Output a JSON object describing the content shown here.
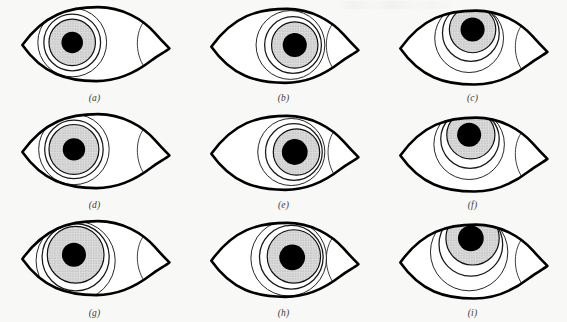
{
  "figure": {
    "caption_top": "",
    "background_color": "#f8f8f6",
    "ink_color": "#000000",
    "iris_fill_color": "#d8d8d8",
    "pupil_color": "#000000",
    "sclera_color": "#ffffff",
    "columns": 3,
    "rows": 3,
    "panel_count": 9
  },
  "panels": [
    {
      "id": "a",
      "label": "(a)",
      "label_letter": "a",
      "gaze": "center",
      "description": "Eye looking straight ahead; iris centred in palpebral fissure",
      "iris": {
        "cx": 66,
        "cy": 47,
        "r": 27,
        "fill": "#d8d8d8"
      },
      "pupil": {
        "cx": 66,
        "cy": 47,
        "r": 12.5,
        "fill": "#000000"
      },
      "limbus_ring": {
        "cx": 66,
        "cy": 47,
        "r": 33
      },
      "outer_ring": {
        "cx": 66,
        "cy": 47,
        "r": 40
      },
      "eye_width": 175,
      "eye_height": 96
    },
    {
      "id": "b",
      "label": "(b)",
      "label_letter": "b",
      "gaze": "right",
      "description": "Eye deviated to the patient's right (viewer's right); iris displaced toward inner canthus",
      "iris": {
        "cx": 105,
        "cy": 50,
        "r": 27,
        "fill": "#d8d8d8"
      },
      "pupil": {
        "cx": 105,
        "cy": 50,
        "r": 14,
        "fill": "#000000"
      },
      "limbus_ring": {
        "cx": 103,
        "cy": 50,
        "r": 33
      },
      "outer_ring": {
        "cx": 100,
        "cy": 50,
        "r": 40
      },
      "eye_width": 175,
      "eye_height": 96
    },
    {
      "id": "c",
      "label": "(c)",
      "label_letter": "c",
      "gaze": "up-right",
      "description": "Eye deviated upward and slightly right; iris rides under the upper lid",
      "iris": {
        "cx": 92,
        "cy": 32,
        "r": 27,
        "fill": "#d8d8d8"
      },
      "pupil": {
        "cx": 92,
        "cy": 32,
        "r": 14,
        "fill": "#000000"
      },
      "limbus_ring": {
        "cx": 90,
        "cy": 36,
        "r": 33
      },
      "outer_ring": {
        "cx": 88,
        "cy": 42,
        "r": 40
      },
      "eye_width": 175,
      "eye_height": 96
    },
    {
      "id": "d",
      "label": "(d)",
      "label_letter": "d",
      "gaze": "center",
      "description": "Eye in primary position; iris centred, pupil mid-dilated",
      "iris": {
        "cx": 68,
        "cy": 47,
        "r": 29,
        "fill": "#d8d8d8"
      },
      "pupil": {
        "cx": 68,
        "cy": 47,
        "r": 13,
        "fill": "#000000"
      },
      "limbus_ring": {
        "cx": 68,
        "cy": 47,
        "r": 34
      },
      "outer_ring": {
        "cx": 68,
        "cy": 47,
        "r": 41
      },
      "eye_width": 175,
      "eye_height": 96
    },
    {
      "id": "e",
      "label": "(e)",
      "label_letter": "e",
      "gaze": "right",
      "description": "Eye deviated to the right; iris abuts the inner canthus",
      "iris": {
        "cx": 107,
        "cy": 50,
        "r": 27,
        "fill": "#d8d8d8"
      },
      "pupil": {
        "cx": 105,
        "cy": 50,
        "r": 15,
        "fill": "#000000"
      },
      "limbus_ring": {
        "cx": 104,
        "cy": 50,
        "r": 33
      },
      "outer_ring": {
        "cx": 101,
        "cy": 50,
        "r": 39
      },
      "eye_width": 175,
      "eye_height": 96
    },
    {
      "id": "f",
      "label": "(f)",
      "label_letter": "f",
      "gaze": "up-right",
      "description": "Eye deviated up and to the right; superior iris hidden by upper lid",
      "iris": {
        "cx": 90,
        "cy": 30,
        "r": 28,
        "fill": "#d8d8d8"
      },
      "pupil": {
        "cx": 88,
        "cy": 30,
        "r": 14,
        "fill": "#000000"
      },
      "limbus_ring": {
        "cx": 89,
        "cy": 35,
        "r": 34
      },
      "outer_ring": {
        "cx": 88,
        "cy": 41,
        "r": 41
      },
      "eye_width": 175,
      "eye_height": 96
    },
    {
      "id": "g",
      "label": "(g)",
      "label_letter": "g",
      "gaze": "center",
      "description": "Eye in primary position with an enlarged iris and central pupil",
      "iris": {
        "cx": 70,
        "cy": 45,
        "r": 33,
        "fill": "#d8d8d8"
      },
      "pupil": {
        "cx": 68,
        "cy": 45,
        "r": 14,
        "fill": "#000000"
      },
      "limbus_ring": {
        "cx": 70,
        "cy": 48,
        "r": 39
      },
      "outer_ring": {
        "cx": 70,
        "cy": 52,
        "r": 46
      },
      "eye_width": 175,
      "eye_height": 96
    },
    {
      "id": "h",
      "label": "(h)",
      "label_letter": "h",
      "gaze": "right",
      "description": "Eye deviated to the right with an enlarged iris",
      "iris": {
        "cx": 104,
        "cy": 47,
        "r": 31,
        "fill": "#d8d8d8"
      },
      "pupil": {
        "cx": 102,
        "cy": 48,
        "r": 15,
        "fill": "#000000"
      },
      "limbus_ring": {
        "cx": 101,
        "cy": 48,
        "r": 37
      },
      "outer_ring": {
        "cx": 98,
        "cy": 49,
        "r": 44
      },
      "eye_width": 175,
      "eye_height": 96
    },
    {
      "id": "i",
      "label": "(i)",
      "label_letter": "i",
      "gaze": "up-right",
      "description": "Eye deviated upward and to the right with an enlarged iris tucked beneath the upper lid",
      "iris": {
        "cx": 92,
        "cy": 26,
        "r": 31,
        "fill": "#d8d8d8"
      },
      "pupil": {
        "cx": 90,
        "cy": 26,
        "r": 15,
        "fill": "#000000"
      },
      "limbus_ring": {
        "cx": 90,
        "cy": 33,
        "r": 37
      },
      "outer_ring": {
        "cx": 88,
        "cy": 42,
        "r": 45
      },
      "eye_width": 175,
      "eye_height": 96
    }
  ]
}
